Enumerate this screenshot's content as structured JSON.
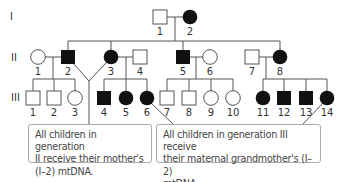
{
  "diagram": {
    "type": "pedigree",
    "trait": "mitochondrial DNA inheritance",
    "colors": {
      "affected": "#111111",
      "unaffected_fill": "#ffffff",
      "line": "#555555",
      "callout_border": "#aaaaaa"
    },
    "generations": [
      {
        "label": "I",
        "individuals": [
          {
            "id": "I-1",
            "num": "1",
            "sex": "male",
            "affected": false
          },
          {
            "id": "I-2",
            "num": "2",
            "sex": "female",
            "affected": true
          }
        ]
      },
      {
        "label": "II",
        "individuals": [
          {
            "id": "II-1",
            "num": "1",
            "sex": "female",
            "affected": false
          },
          {
            "id": "II-2",
            "num": "2",
            "sex": "male",
            "affected": true
          },
          {
            "id": "II-3",
            "num": "3",
            "sex": "female",
            "affected": true
          },
          {
            "id": "II-4",
            "num": "4",
            "sex": "male",
            "affected": false
          },
          {
            "id": "II-5",
            "num": "5",
            "sex": "male",
            "affected": true
          },
          {
            "id": "II-6",
            "num": "6",
            "sex": "female",
            "affected": false
          },
          {
            "id": "II-7",
            "num": "7",
            "sex": "male",
            "affected": false
          },
          {
            "id": "II-8",
            "num": "8",
            "sex": "female",
            "affected": true
          }
        ]
      },
      {
        "label": "III",
        "individuals": [
          {
            "id": "III-1",
            "num": "1",
            "sex": "male",
            "affected": false
          },
          {
            "id": "III-2",
            "num": "2",
            "sex": "male",
            "affected": false
          },
          {
            "id": "III-3",
            "num": "3",
            "sex": "female",
            "affected": false
          },
          {
            "id": "III-4",
            "num": "4",
            "sex": "male",
            "affected": true
          },
          {
            "id": "III-5",
            "num": "5",
            "sex": "female",
            "affected": true
          },
          {
            "id": "III-6",
            "num": "6",
            "sex": "female",
            "affected": true
          },
          {
            "id": "III-7",
            "num": "7",
            "sex": "male",
            "affected": false
          },
          {
            "id": "III-8",
            "num": "8",
            "sex": "male",
            "affected": false
          },
          {
            "id": "III-9",
            "num": "9",
            "sex": "female",
            "affected": false
          },
          {
            "id": "III-10",
            "num": "10",
            "sex": "female",
            "affected": false
          },
          {
            "id": "III-11",
            "num": "11",
            "sex": "female",
            "affected": true
          },
          {
            "id": "III-12",
            "num": "12",
            "sex": "male",
            "affected": true
          },
          {
            "id": "III-13",
            "num": "13",
            "sex": "male",
            "affected": true
          },
          {
            "id": "III-14",
            "num": "14",
            "sex": "female",
            "affected": true
          }
        ]
      }
    ],
    "callouts": [
      {
        "text": "All children in generation II receive their mother's (I–2) mtDNA.",
        "lines": [
          "All children in generation",
          "II receive their mother's",
          "(I–2) mtDNA."
        ]
      },
      {
        "text": "All children in generation III receive their maternal grandmother's (I–2) mtDNA.",
        "lines": [
          "All children in generation III receive",
          "their maternal grandmother's (I–2)",
          "mtDNA."
        ]
      }
    ]
  }
}
